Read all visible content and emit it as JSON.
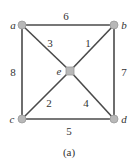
{
  "graph": {
    "nodes": {
      "a": {
        "label": "a",
        "x": 22,
        "y": 25
      },
      "b": {
        "label": "b",
        "x": 114,
        "y": 25
      },
      "c": {
        "label": "c",
        "x": 22,
        "y": 119
      },
      "d": {
        "label": "d",
        "x": 114,
        "y": 119
      },
      "e": {
        "label": "e",
        "x": 70,
        "y": 71
      }
    },
    "edges": [
      {
        "from": "a",
        "to": "b",
        "weight": "6"
      },
      {
        "from": "b",
        "to": "e",
        "weight": "1"
      },
      {
        "from": "a",
        "to": "e",
        "weight": "3"
      },
      {
        "from": "a",
        "to": "c",
        "weight": "8"
      },
      {
        "from": "b",
        "to": "d",
        "weight": "7"
      },
      {
        "from": "c",
        "to": "e",
        "weight": "2"
      },
      {
        "from": "e",
        "to": "d",
        "weight": "4"
      },
      {
        "from": "c",
        "to": "d",
        "weight": "5"
      }
    ]
  },
  "caption": "(a)"
}
